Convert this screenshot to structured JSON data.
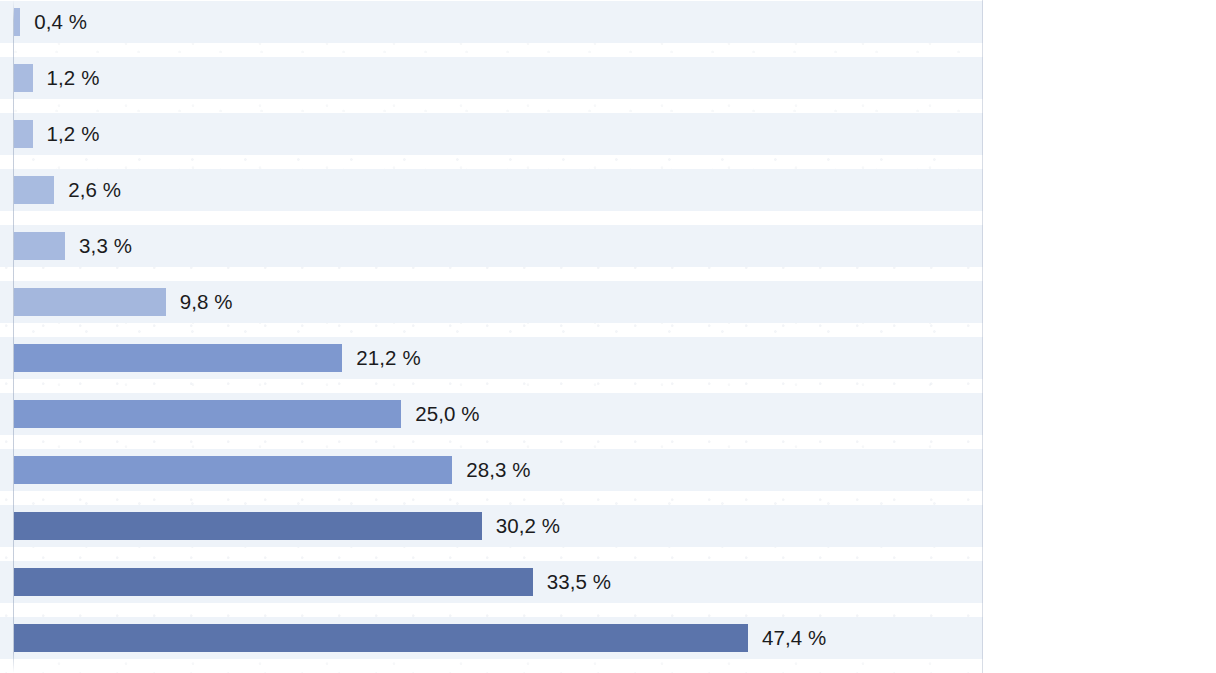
{
  "chart_data": {
    "type": "bar",
    "orientation": "horizontal",
    "title": "",
    "subtitle": "",
    "xlabel": "",
    "ylabel": "",
    "xlim": [
      0,
      47.4
    ],
    "grid": false,
    "legend": null,
    "value_suffix": " %",
    "decimal_separator": ",",
    "categories": [
      "Handball",
      "Squash / Badminton",
      "Tennis / Tischtennis",
      "Skifahren",
      "Reiten",
      "Tanzen",
      "Wandern",
      "Sonstige Sportarten",
      "Schwimmen",
      "Joggen / Walken",
      "Radfahren",
      "Fitness / Gymnastik"
    ],
    "values": [
      0.4,
      1.2,
      1.2,
      2.6,
      3.3,
      9.8,
      21.2,
      25.0,
      28.3,
      30.2,
      33.5,
      47.4
    ],
    "value_labels": [
      "0,4 %",
      "1,2 %",
      "1,2 %",
      "2,6 %",
      "3,3 %",
      "9,8 %",
      "21,2 %",
      "25,0 %",
      "28,3 %",
      "30,2 %",
      "33,5 %",
      "47,4 %"
    ],
    "bar_colors": [
      "#a9bbe0",
      "#a9bbe0",
      "#a9bbe0",
      "#a8bbe0",
      "#a6b9df",
      "#a4b7dd",
      "#7e98cf",
      "#7e98cf",
      "#7e98cf",
      "#5b74ab",
      "#5b74ab",
      "#5b74ab"
    ]
  },
  "style": {
    "row_band_color": "#eef3f9",
    "page_background": "#ffffff",
    "value_text_color": "#1b1b1d",
    "label_text_color": "#1d1d1f",
    "axis_line_color": "#96a5be"
  }
}
